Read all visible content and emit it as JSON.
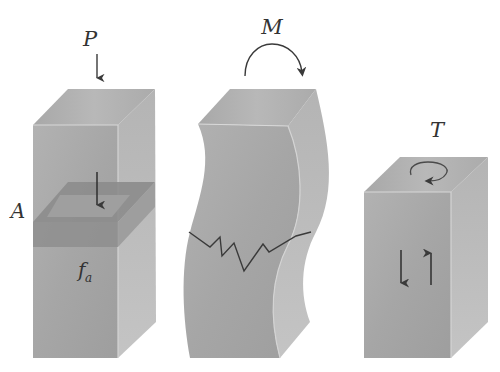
{
  "figure": {
    "colors": {
      "front_face": "#a9a9a9",
      "top_face": "#b3b3b3",
      "side_face": "#bfbfbf",
      "section_band": "#8c8c8c",
      "section_inner": "#a0a0a0",
      "edge_highlight": "#d8d8d8",
      "stroke": "#3a3a3a",
      "crack": "#3a3a3a"
    },
    "panels": [
      {
        "id": "axial",
        "load_label": "P",
        "area_label": "A",
        "stress_label_main": "f",
        "stress_label_sub": "a",
        "load_arrow": "down-arrow",
        "internal_arrow": "down-arrow"
      },
      {
        "id": "bending",
        "load_label": "M",
        "load_arrow": "clockwise-arc-arrow",
        "feature": "zigzag crack across bent block"
      },
      {
        "id": "torsion",
        "load_label": "T",
        "load_arrow": "circular-arrow-on-top-face",
        "shear_arrows": [
          "down-arrow",
          "up-arrow"
        ]
      }
    ]
  }
}
